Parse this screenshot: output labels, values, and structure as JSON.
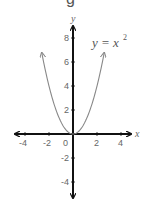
{
  "top_fragment": "g",
  "chart_data": {
    "type": "line",
    "title": "",
    "annotation": "y = x²",
    "equation": {
      "lhs": "y",
      "eq": "=",
      "base": "x",
      "exp": "2"
    },
    "xlabel": "x",
    "ylabel": "y",
    "xlim": [
      -4.9,
      4.9
    ],
    "ylim": [
      -5.5,
      9
    ],
    "x_ticks": [
      -4,
      -2,
      0,
      2,
      4
    ],
    "x_tick_labels": [
      "-4",
      "-2",
      "0",
      "2",
      "4"
    ],
    "y_ticks": [
      8,
      6,
      4,
      2,
      -2,
      -4
    ],
    "y_tick_labels": [
      "8",
      "6",
      "4",
      "2",
      "-2",
      "-4"
    ],
    "grid": false,
    "series": [
      {
        "name": "y = x^2",
        "color": "#888888",
        "x": [
          -2.6,
          -2,
          -1.5,
          -1,
          -0.5,
          0,
          0.5,
          1,
          1.5,
          2,
          2.6
        ],
        "y": [
          6.76,
          4,
          2.25,
          1,
          0.25,
          0,
          0.25,
          1,
          2.25,
          4,
          6.76
        ]
      }
    ],
    "axis_color": "#111111"
  }
}
